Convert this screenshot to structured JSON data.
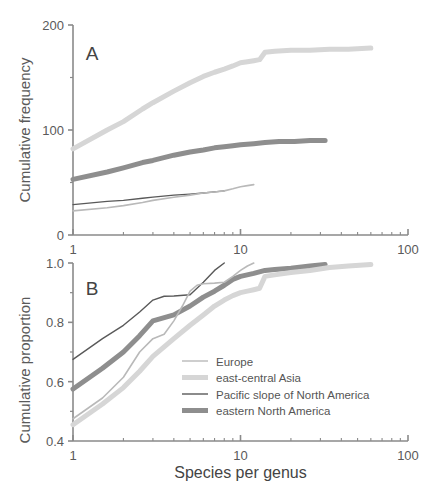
{
  "figure": {
    "xlabel": "Species per genus",
    "panels": [
      {
        "id": "A",
        "label": "A",
        "ylabel": "Cumulative frequency"
      },
      {
        "id": "B",
        "label": "B",
        "ylabel": "Cumulative proportion"
      }
    ]
  },
  "legend": {
    "items": [
      {
        "label": "Europe",
        "color": "#b9b9b9",
        "width": 1.4
      },
      {
        "label": "east-central Asia",
        "color": "#d6d6d6",
        "width": 5.0
      },
      {
        "label": "Pacific slope of North America",
        "color": "#595959",
        "width": 1.4
      },
      {
        "label": "eastern North America",
        "color": "#8e8e8e",
        "width": 5.0
      }
    ]
  },
  "chart_data": [
    {
      "type": "line",
      "panel": "A",
      "title": "A",
      "xlabel": "Species per genus",
      "ylabel": "Cumulative frequency",
      "xscale": "log",
      "xlim": [
        1,
        100
      ],
      "ylim": [
        0,
        200
      ],
      "xticks": [
        1,
        10,
        100
      ],
      "xticklabels": [
        "1",
        "10",
        "100"
      ],
      "yticks": [
        0,
        100,
        200
      ],
      "yticklabels": [
        "0",
        "100",
        "200"
      ],
      "grid": false,
      "legend_position": "none",
      "series": [
        {
          "name": "east-central Asia",
          "color": "#d6d6d6",
          "width": 5.0,
          "x": [
            1,
            1.6,
            2,
            2.6,
            3,
            4,
            5,
            6,
            7,
            8,
            9,
            10,
            11,
            12,
            13,
            14,
            16,
            20,
            26,
            34,
            44,
            60
          ],
          "y": [
            82,
            100,
            108,
            120,
            126,
            137,
            145,
            151,
            155,
            158,
            161,
            164,
            165,
            166,
            167,
            174,
            175,
            176,
            176,
            177,
            177,
            178
          ]
        },
        {
          "name": "eastern North America",
          "color": "#8e8e8e",
          "width": 5.0,
          "x": [
            1,
            1.6,
            2,
            2.6,
            3,
            4,
            5,
            6,
            7,
            8,
            9,
            10,
            12,
            14,
            17,
            21,
            26,
            32
          ],
          "y": [
            53,
            60,
            64,
            69,
            71,
            76,
            79,
            81,
            83,
            84,
            85,
            86,
            87,
            88,
            89,
            89,
            90,
            90
          ]
        },
        {
          "name": "Pacific slope of North America",
          "color": "#595959",
          "width": 1.3,
          "x": [
            1,
            1.6,
            2,
            2.6,
            3,
            4,
            5,
            6,
            7,
            8
          ],
          "y": [
            29,
            32,
            33,
            35,
            36,
            38,
            39,
            40,
            41,
            42
          ]
        },
        {
          "name": "Europe",
          "color": "#b9b9b9",
          "width": 1.6,
          "x": [
            1,
            1.6,
            2,
            2.6,
            3,
            4,
            5,
            6,
            7,
            8,
            9,
            10,
            11,
            12
          ],
          "y": [
            23,
            26,
            28,
            31,
            33,
            36,
            38,
            40,
            41,
            42,
            44,
            46,
            47,
            48
          ]
        }
      ]
    },
    {
      "type": "line",
      "panel": "B",
      "title": "B",
      "xlabel": "Species per genus",
      "ylabel": "Cumulative proportion",
      "xscale": "log",
      "xlim": [
        1,
        100
      ],
      "ylim": [
        0.4,
        1.0
      ],
      "xticks": [
        1,
        10,
        100
      ],
      "xticklabels": [
        "1",
        "10",
        "100"
      ],
      "yticks": [
        0.4,
        0.6,
        0.8,
        1.0
      ],
      "yticklabels": [
        "0.4",
        "0.6",
        "0.8",
        "1.0"
      ],
      "grid": false,
      "legend_position": "inside-lower-right",
      "series": [
        {
          "name": "Pacific slope of North America",
          "color": "#595959",
          "width": 1.4,
          "x": [
            1,
            1.5,
            2,
            2.5,
            3,
            3.5,
            4,
            5,
            6,
            7,
            8
          ],
          "y": [
            0.675,
            0.745,
            0.79,
            0.835,
            0.875,
            0.888,
            0.889,
            0.893,
            0.935,
            0.975,
            1.0
          ]
        },
        {
          "name": "eastern North America",
          "color": "#8e8e8e",
          "width": 5.0,
          "x": [
            1,
            1.5,
            2,
            2.5,
            3,
            4,
            5,
            6,
            7,
            8,
            9,
            10,
            12,
            14,
            16,
            20,
            26,
            32
          ],
          "y": [
            0.575,
            0.645,
            0.7,
            0.755,
            0.805,
            0.825,
            0.855,
            0.885,
            0.905,
            0.925,
            0.945,
            0.955,
            0.965,
            0.975,
            0.978,
            0.982,
            0.99,
            0.995
          ]
        },
        {
          "name": "Europe",
          "color": "#b9b9b9",
          "width": 1.6,
          "x": [
            1,
            1.5,
            2,
            2.5,
            3,
            3.5,
            4,
            4.5,
            5,
            5.5,
            6,
            7,
            8,
            9,
            10,
            11,
            12
          ],
          "y": [
            0.475,
            0.545,
            0.615,
            0.7,
            0.745,
            0.76,
            0.805,
            0.855,
            0.905,
            0.925,
            0.93,
            0.932,
            0.935,
            0.955,
            0.975,
            0.99,
            1.0
          ]
        },
        {
          "name": "east-central Asia",
          "color": "#d6d6d6",
          "width": 5.0,
          "x": [
            1,
            1.5,
            2,
            2.5,
            3,
            4,
            5,
            6,
            7,
            8,
            9,
            10,
            11,
            12,
            13,
            14,
            16,
            20,
            26,
            34,
            44,
            60
          ],
          "y": [
            0.455,
            0.525,
            0.58,
            0.635,
            0.685,
            0.745,
            0.79,
            0.825,
            0.855,
            0.875,
            0.89,
            0.9,
            0.905,
            0.91,
            0.915,
            0.955,
            0.96,
            0.968,
            0.975,
            0.985,
            0.99,
            0.995
          ]
        }
      ]
    }
  ]
}
